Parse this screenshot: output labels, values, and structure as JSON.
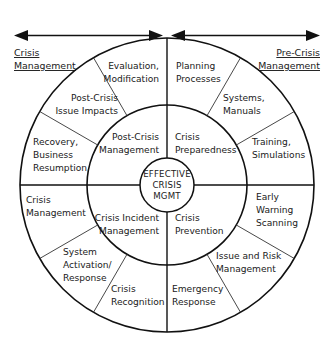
{
  "diagram": {
    "title_center": {
      "line1": "EFFECTIVE",
      "line2": "CRISIS",
      "line3": "MGMT"
    },
    "axis_labels": {
      "left": {
        "line1": "Crisis",
        "line2": "Management"
      },
      "right": {
        "line1": "Pre-Crisis",
        "line2": "Management"
      }
    },
    "inner_ring": [
      {
        "name": "post-crisis-management",
        "line1": "Post-Crisis",
        "line2": "Management"
      },
      {
        "name": "crisis-preparedness",
        "line1": "Crisis",
        "line2": "Preparedness"
      },
      {
        "name": "crisis-prevention",
        "line1": "Crisis",
        "line2": "Prevention"
      },
      {
        "name": "crisis-incident-management",
        "line1": "Crisis Incident",
        "line2": "Management"
      }
    ],
    "outer_ring": [
      {
        "name": "evaluation-modification",
        "line1": "Evaluation,",
        "line2": "Modification",
        "line3": ""
      },
      {
        "name": "post-crisis-issue-impacts",
        "line1": "Post-Crisis",
        "line2": "Issue Impacts",
        "line3": ""
      },
      {
        "name": "recovery-business-resumption",
        "line1": "Recovery,",
        "line2": "Business",
        "line3": "Resumption"
      },
      {
        "name": "crisis-management",
        "line1": "Crisis",
        "line2": "Management",
        "line3": ""
      },
      {
        "name": "system-activation-response",
        "line1": "System",
        "line2": "Activation/",
        "line3": "Response"
      },
      {
        "name": "crisis-recognition",
        "line1": "Crisis",
        "line2": "Recognition",
        "line3": ""
      },
      {
        "name": "emergency-response",
        "line1": "Emergency",
        "line2": "Response",
        "line3": ""
      },
      {
        "name": "issue-and-risk-management",
        "line1": "Issue and Risk",
        "line2": "Management",
        "line3": ""
      },
      {
        "name": "early-warning-scanning",
        "line1": "Early",
        "line2": "Warning",
        "line3": "Scanning"
      },
      {
        "name": "training-simulations",
        "line1": "Training,",
        "line2": "Simulations",
        "line3": ""
      },
      {
        "name": "systems-manuals",
        "line1": "Systems,",
        "line2": "Manuals",
        "line3": ""
      },
      {
        "name": "planning-processes",
        "line1": "Planning",
        "line2": "Processes",
        "line3": ""
      }
    ],
    "colors": {
      "stroke": "#111111",
      "text": "#1a1a1a",
      "background": "#ffffff"
    }
  }
}
